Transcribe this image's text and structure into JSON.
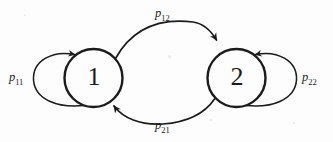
{
  "diagram": {
    "kind": "state-transition-diagram",
    "stroke_color": "#1b1b1b",
    "background_color": "#fdfdfd",
    "nodes": [
      {
        "id": "state-1",
        "label": "1",
        "cx": 93.5,
        "cy": 78,
        "r": 29
      },
      {
        "id": "state-2",
        "label": "2",
        "cx": 236.5,
        "cy": 78,
        "r": 29
      }
    ],
    "edges": [
      {
        "id": "self-loop-1",
        "label_base": "p",
        "label_sub": "11",
        "from": "state-1",
        "to": "state-1",
        "kind": "self-loop",
        "side": "left",
        "label_x": 9,
        "label_y": 70
      },
      {
        "id": "transition-1-to-2",
        "label_base": "p",
        "label_sub": "12",
        "from": "state-1",
        "to": "state-2",
        "kind": "arc",
        "side": "top",
        "label_x": 155,
        "label_y": 6
      },
      {
        "id": "transition-2-to-1",
        "label_base": "p",
        "label_sub": "21",
        "from": "state-2",
        "to": "state-1",
        "kind": "arc",
        "side": "bottom",
        "label_x": 155,
        "label_y": 118
      },
      {
        "id": "self-loop-2",
        "label_base": "p",
        "label_sub": "22",
        "from": "state-2",
        "to": "state-2",
        "kind": "self-loop",
        "side": "right",
        "label_x": 302,
        "label_y": 70
      }
    ]
  }
}
